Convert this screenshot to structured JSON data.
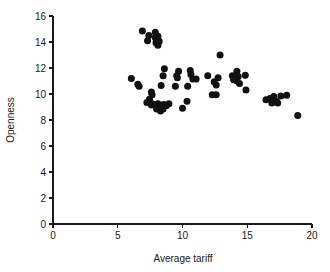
{
  "chart_data": {
    "type": "scatter",
    "title": "",
    "xlabel": "Average  tariff",
    "ylabel": "Openness",
    "xlim": [
      0,
      20
    ],
    "ylim": [
      0,
      16
    ],
    "xticks": [
      0,
      5,
      10,
      15,
      20
    ],
    "yticks": [
      0,
      2,
      4,
      6,
      8,
      10,
      12,
      14,
      16
    ],
    "xtick_labels": [
      "0",
      "5",
      "10",
      "15",
      "20"
    ],
    "ytick_labels": [
      "0",
      "2",
      "4",
      "6",
      "8",
      "10",
      "12",
      "14",
      "16"
    ],
    "grid": false,
    "legend": null,
    "marker": {
      "shape": "circle",
      "color": "#111111",
      "size_px": 4.6
    },
    "series": [
      {
        "name": "countries",
        "color": "#111111",
        "points": [
          [
            6.9,
            14.85
          ],
          [
            7.4,
            14.5
          ],
          [
            7.9,
            14.75
          ],
          [
            7.3,
            14.1
          ],
          [
            7.9,
            14.35
          ],
          [
            8.1,
            14.45
          ],
          [
            8.0,
            14.2
          ],
          [
            7.95,
            13.95
          ],
          [
            8.1,
            13.75
          ],
          [
            8.2,
            14.05
          ],
          [
            12.9,
            13.0
          ],
          [
            8.6,
            11.95
          ],
          [
            9.7,
            11.75
          ],
          [
            10.6,
            11.8
          ],
          [
            14.2,
            11.75
          ],
          [
            11.95,
            11.4
          ],
          [
            8.5,
            11.4
          ],
          [
            9.55,
            11.4
          ],
          [
            10.65,
            11.5
          ],
          [
            13.85,
            11.4
          ],
          [
            14.3,
            11.35
          ],
          [
            14.85,
            11.45
          ],
          [
            6.05,
            11.2
          ],
          [
            9.6,
            11.25
          ],
          [
            10.8,
            11.15
          ],
          [
            11.05,
            11.15
          ],
          [
            12.75,
            11.25
          ],
          [
            13.95,
            11.1
          ],
          [
            14.2,
            11.0
          ],
          [
            14.4,
            10.8
          ],
          [
            6.55,
            10.75
          ],
          [
            6.65,
            10.6
          ],
          [
            8.35,
            10.65
          ],
          [
            9.45,
            10.6
          ],
          [
            12.45,
            10.95
          ],
          [
            12.6,
            10.7
          ],
          [
            10.4,
            10.6
          ],
          [
            14.9,
            10.3
          ],
          [
            7.6,
            10.15
          ],
          [
            7.65,
            9.95
          ],
          [
            12.6,
            9.95
          ],
          [
            7.45,
            9.6
          ],
          [
            7.5,
            9.4
          ],
          [
            7.25,
            9.35
          ],
          [
            10.35,
            9.45
          ],
          [
            12.3,
            9.95
          ],
          [
            16.45,
            9.55
          ],
          [
            16.75,
            9.65
          ],
          [
            17.05,
            9.8
          ],
          [
            17.1,
            9.5
          ],
          [
            17.25,
            9.45
          ],
          [
            17.35,
            9.3
          ],
          [
            17.6,
            9.85
          ],
          [
            18.05,
            9.9
          ],
          [
            16.9,
            9.3
          ],
          [
            7.6,
            9.15
          ],
          [
            7.75,
            9.2
          ],
          [
            8.1,
            9.25
          ],
          [
            8.45,
            9.15
          ],
          [
            8.55,
            9.2
          ],
          [
            8.75,
            9.1
          ],
          [
            8.95,
            9.25
          ],
          [
            8.5,
            8.85
          ],
          [
            8.3,
            8.7
          ],
          [
            8.0,
            8.85
          ],
          [
            10.0,
            8.9
          ],
          [
            18.9,
            8.35
          ]
        ]
      }
    ]
  },
  "figure": {
    "axis_label_x": "Average  tariff",
    "axis_label_y": "Openness"
  }
}
